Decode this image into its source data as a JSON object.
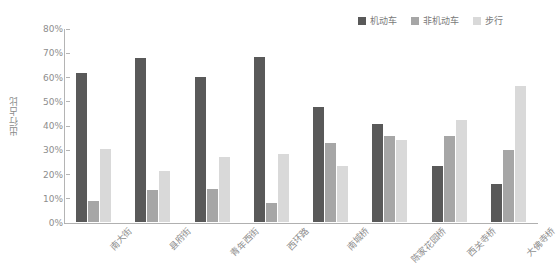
{
  "chart_data": {
    "type": "bar",
    "title": "",
    "subtitle": "",
    "xlabel": "",
    "ylabel": "出行占比",
    "ylim": [
      0,
      80
    ],
    "grid": false,
    "legend_position": "top-right",
    "ytick_labels": [
      "80%",
      "70%",
      "60%",
      "50%",
      "40%",
      "30%",
      "20%",
      "10%",
      "0%"
    ],
    "ytick_values": [
      80,
      70,
      60,
      50,
      40,
      30,
      20,
      10,
      0
    ],
    "categories": [
      "南大街",
      "县府街",
      "青年西街",
      "西环路",
      "南城桥",
      "陈家花园桥",
      "西关寺桥",
      "大佛寺桥"
    ],
    "series": [
      {
        "name": "机动车",
        "color": "#595959",
        "values": [
          61.5,
          67.5,
          60.0,
          68.0,
          47.5,
          40.5,
          23.0,
          15.5
        ]
      },
      {
        "name": "非机动车",
        "color": "#a6a6a6",
        "values": [
          8.5,
          13.0,
          13.5,
          8.0,
          32.5,
          35.5,
          35.5,
          29.5
        ]
      },
      {
        "name": "步行",
        "color": "#d9d9d9",
        "values": [
          30.0,
          21.0,
          27.0,
          28.0,
          23.0,
          34.0,
          42.0,
          56.0
        ]
      }
    ]
  },
  "colors": {
    "axis": "#b4b4b4",
    "text": "#8d8d8d",
    "background": "#ffffff",
    "series_1": "#595959",
    "series_2": "#a6a6a6",
    "series_3": "#d9d9d9"
  }
}
